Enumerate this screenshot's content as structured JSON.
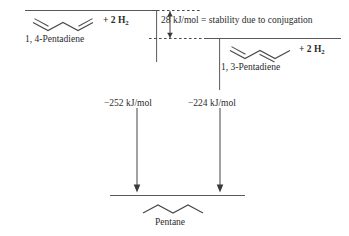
{
  "diagram": {
    "title_text": "",
    "reactant_left": {
      "name": "1, 4-Pentadiene",
      "hydrogen_label": "+ 2 H",
      "hydrogen_sub": "2",
      "enthalpy": "−252 kJ/mol",
      "structure_icon": "pentadiene-1-4-skeletal"
    },
    "reactant_right": {
      "name": "1, 3-Pentadiene",
      "hydrogen_label": "+ 2 H",
      "hydrogen_sub": "2",
      "enthalpy": "−224 kJ/mol",
      "structure_icon": "pentadiene-1-3-skeletal"
    },
    "stabilization": {
      "text": "28 kJ/mol = stability due to conjugation",
      "value": "28 kJ/mol",
      "caption": "stability due to conjugation"
    },
    "product": {
      "name": "Pentane",
      "structure_icon": "pentane-skeletal"
    },
    "colors": {
      "line": "#5a5a5a",
      "text": "#2b2b2b",
      "arrow": "#3a3a3a",
      "background": "#ffffff"
    }
  }
}
